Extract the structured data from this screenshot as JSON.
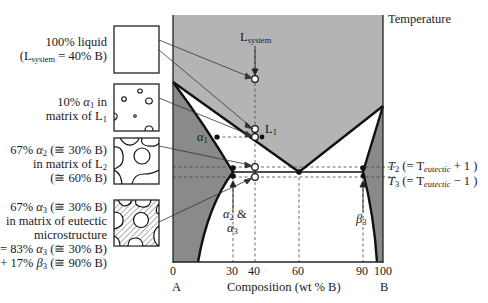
{
  "figure": {
    "type": "binary eutectic phase diagram with microstructure evolution",
    "y_axis_label": "Temperature",
    "x_axis_label": "Composition (wt % B)",
    "x_ticks": [
      "0",
      "30",
      "40",
      "60",
      "90",
      "100"
    ],
    "component_left": "A",
    "component_right": "B",
    "point_labels": {
      "l_system": "L",
      "l_system_sub": "system",
      "l1": "L",
      "l1_sub": "1",
      "alpha1": "α",
      "alpha1_sub": "1",
      "alpha23_line1": "α",
      "alpha23_line1_sub": "2",
      "alpha23_amp": " &",
      "alpha23_line2": "α",
      "alpha23_line2_sub": "3",
      "beta3": "β",
      "beta3_sub": "3"
    },
    "temperature_labels": {
      "t2_T": "T",
      "t2_sub": "2",
      "t2_rest": " (= T",
      "t2_eut": "eutectic",
      "t2_end": " + 1 )",
      "t3_T": "T",
      "t3_sub": "3",
      "t3_rest": " (= T",
      "t3_eut": "eutectic",
      "t3_end": " − 1 )"
    },
    "microstructures": [
      {
        "line1": "100% liquid",
        "line2_a": "(L",
        "line2_sub": "system",
        "line2_b": " = 40% B)"
      },
      {
        "line1_a": "10% ",
        "line1_greek": "α",
        "line1_sub": "1",
        "line1_b": " in",
        "line2_a": "matrix of L",
        "line2_sub": "1"
      },
      {
        "line1_a": "67% ",
        "line1_greek": "α",
        "line1_sub": "2",
        "line1_b": " (≅ 30% B)",
        "line2_a": "in matrix of L",
        "line2_sub": "2",
        "line3": "(≅ 60% B)"
      },
      {
        "line1_a": "67% ",
        "line1_greek": "α",
        "line1_sub": "3",
        "line1_b": " (≅ 30% B)",
        "line2": "in matrix of eutectic",
        "line3": "microstructure",
        "line4_a": "= 83% ",
        "line4_greek": "α",
        "line4_sub": "3",
        "line4_b": " (≅ 30% B)",
        "line5_a": "+ 17% ",
        "line5_greek": "β",
        "line5_sub": "3",
        "line5_b": " (≅ 90% B)"
      }
    ],
    "key_compositions_wt_pct_B": {
      "system": 40,
      "alpha_at_eutectic": 30,
      "eutectic": 60,
      "beta_at_eutectic": 90
    },
    "colors": {
      "liquid_region": "#b4b4b4",
      "solid_solution_region": "#8a8a8a",
      "two_phase_region": "#ffffff",
      "lines": "#111111"
    }
  }
}
